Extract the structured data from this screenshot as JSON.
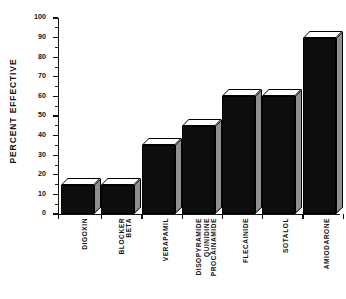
{
  "chart_data": {
    "type": "bar",
    "title": "",
    "subtitle": "",
    "xlabel": "",
    "ylabel": "PERCENT EFFECTIVE",
    "ylim": [
      0,
      100
    ],
    "ytick_step": 10,
    "yminor_step": 5,
    "grid": false,
    "legend": "none",
    "style": "3d-black-bars",
    "categories": [
      "DIGOXIN",
      "BETA BLOCKER",
      "VERAPAMIL",
      "PROCAINAMIDE QUINIDINE DISOPYRAMIDE",
      "FLECAINIDE",
      "SOTALOL",
      "AMIODARONE"
    ],
    "category_lines": [
      [
        "DIGOXIN"
      ],
      [
        "BETA",
        "BLOCKER"
      ],
      [
        "VERAPAMIL"
      ],
      [
        "PROCAINAMIDE",
        "QUINIDINE",
        "DISOPYRAMIDE"
      ],
      [
        "FLECAINIDE"
      ],
      [
        "SOTALOL"
      ],
      [
        "AMIODARONE"
      ]
    ],
    "values": [
      15,
      15,
      35,
      45,
      60,
      60,
      90
    ],
    "ytick_labels": [
      "0",
      "10",
      "20",
      "30",
      "40",
      "50",
      "60",
      "70",
      "80",
      "90",
      "100"
    ],
    "colors": {
      "bar_face": "#0d0d0d",
      "bar_top": "#ffffff",
      "bar_side": "#8f8f8f",
      "outline": "#000000",
      "axis": "#111111",
      "background": "#ffffff",
      "text": "#141414"
    }
  },
  "axis": {
    "y_title": "PERCENT EFFECTIVE",
    "ticks": [
      {
        "label": "0",
        "value": 0
      },
      {
        "label": "10",
        "value": 10
      },
      {
        "label": "20",
        "value": 20
      },
      {
        "label": "30",
        "value": 30
      },
      {
        "label": "40",
        "value": 40
      },
      {
        "label": "50",
        "value": 50
      },
      {
        "label": "60",
        "value": 60
      },
      {
        "label": "70",
        "value": 70
      },
      {
        "label": "80",
        "value": 80
      },
      {
        "label": "90",
        "value": 90
      },
      {
        "label": "100",
        "value": 100
      }
    ]
  }
}
